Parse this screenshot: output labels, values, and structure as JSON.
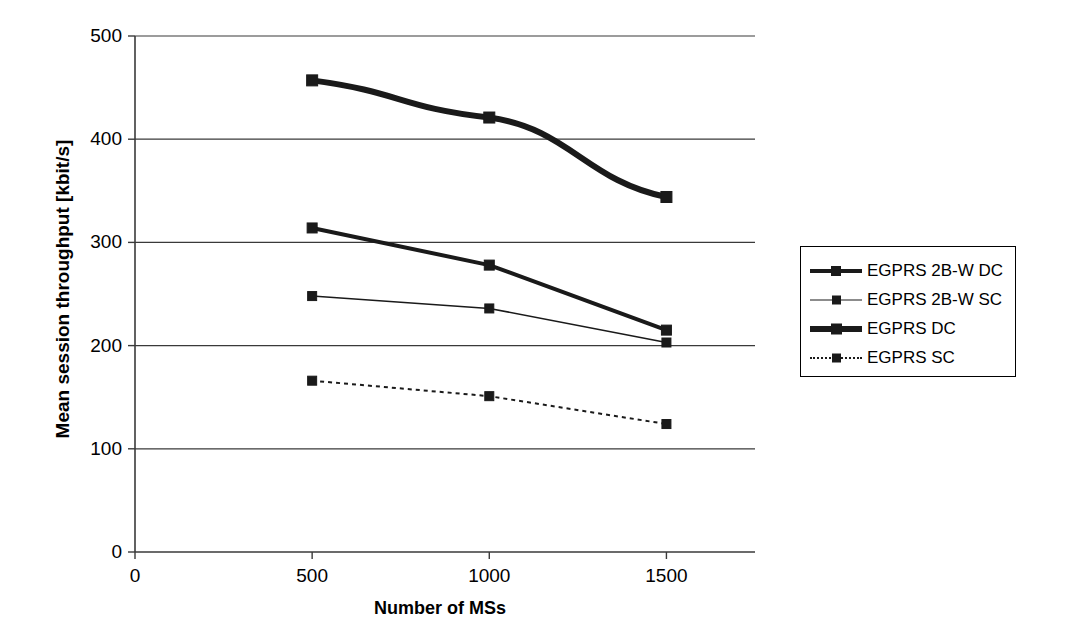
{
  "chart_data": {
    "type": "line",
    "title": "",
    "xlabel": "Number of MSs",
    "ylabel": "Mean session throughput [kbit/s]",
    "x": [
      500,
      1000,
      1500
    ],
    "xlim": [
      0,
      1750
    ],
    "ylim": [
      0,
      500
    ],
    "xticks": [
      0,
      500,
      1000,
      1500
    ],
    "yticks": [
      0,
      100,
      200,
      300,
      400,
      500
    ],
    "xtick_labels": [
      "0",
      "500",
      "1000",
      "1500"
    ],
    "ytick_labels": [
      "0",
      "100",
      "200",
      "300",
      "400",
      "500"
    ],
    "grid": "horizontal",
    "legend_position": "right",
    "series": [
      {
        "name": "EGPRS 2B-W DC",
        "values": [
          314,
          278,
          215
        ],
        "style": "solid",
        "width": 4,
        "color": "#1a1a1a",
        "marker": "square"
      },
      {
        "name": "EGPRS 2B-W SC",
        "values": [
          248,
          236,
          203
        ],
        "style": "solid",
        "width": 1.6,
        "color": "#1a1a1a",
        "marker": "square"
      },
      {
        "name": "EGPRS DC",
        "values": [
          457,
          421,
          344
        ],
        "style": "solid",
        "width": 6,
        "color": "#1a1a1a",
        "marker": "square"
      },
      {
        "name": "EGPRS SC",
        "values": [
          166,
          151,
          124
        ],
        "style": "dotted",
        "width": 2,
        "color": "#1a1a1a",
        "marker": "square"
      }
    ]
  },
  "legend": {
    "items": [
      {
        "label": "EGPRS 2B-W DC"
      },
      {
        "label": "EGPRS 2B-W SC"
      },
      {
        "label": "EGPRS DC"
      },
      {
        "label": "EGPRS SC"
      }
    ]
  },
  "axes": {
    "y_title": "Mean session throughput [kbit/s]",
    "x_title": "Number of MSs"
  }
}
